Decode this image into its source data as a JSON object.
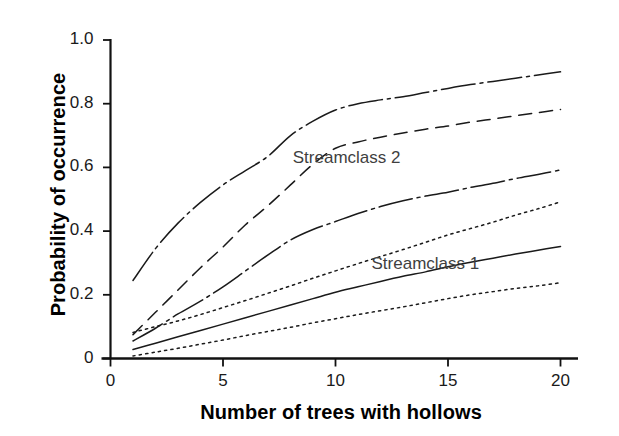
{
  "chart_data": {
    "type": "line",
    "title": "",
    "xlabel": "Number of trees with hollows",
    "ylabel": "Probability of occurrence",
    "xlim": [
      0,
      20.6
    ],
    "ylim": [
      0,
      1.0
    ],
    "grid": false,
    "legend_position": "inline-annotations",
    "xticks": [
      0,
      5,
      10,
      15,
      20
    ],
    "xtick_labels": [
      "0",
      "5",
      "10",
      "15",
      "20"
    ],
    "yticks": [
      0,
      0.2,
      0.4,
      0.6,
      0.8,
      1.0
    ],
    "ytick_labels": [
      "0",
      "0.2",
      "0.4",
      "0.6",
      "0.8",
      "1.0"
    ],
    "x": [
      1,
      2,
      3,
      4,
      5,
      6,
      7,
      8,
      9,
      10,
      11,
      12,
      13,
      14,
      15,
      16,
      17,
      18,
      19,
      20
    ],
    "annotations": [
      {
        "text": "Streamclass 2",
        "x": 8.1,
        "y": 0.625
      },
      {
        "text": "Streamclass 1",
        "x": 11.6,
        "y": 0.295
      }
    ],
    "series": [
      {
        "name": "curve-1",
        "style": "dash-dot",
        "color": "#1a1a1a",
        "values": [
          0.245,
          0.345,
          0.425,
          0.49,
          0.545,
          0.59,
          0.635,
          0.7,
          0.745,
          0.78,
          0.8,
          0.812,
          0.822,
          0.835,
          0.848,
          0.86,
          0.87,
          0.88,
          0.89,
          0.9
        ]
      },
      {
        "name": "curve-2",
        "style": "dashed",
        "color": "#1a1a1a",
        "values": [
          0.075,
          0.145,
          0.215,
          0.285,
          0.35,
          0.42,
          0.48,
          0.545,
          0.61,
          0.66,
          0.68,
          0.695,
          0.708,
          0.72,
          0.73,
          0.742,
          0.752,
          0.762,
          0.772,
          0.782
        ]
      },
      {
        "name": "curve-3",
        "style": "dash-dot",
        "color": "#1a1a1a",
        "values": [
          0.055,
          0.095,
          0.14,
          0.18,
          0.225,
          0.275,
          0.325,
          0.372,
          0.405,
          0.43,
          0.455,
          0.477,
          0.495,
          0.51,
          0.522,
          0.537,
          0.55,
          0.565,
          0.578,
          0.592
        ]
      },
      {
        "name": "curve-4",
        "style": "dotted",
        "color": "#1a1a1a",
        "values": [
          0.082,
          0.1,
          0.118,
          0.138,
          0.16,
          0.182,
          0.205,
          0.228,
          0.252,
          0.275,
          0.298,
          0.32,
          0.342,
          0.365,
          0.388,
          0.408,
          0.428,
          0.45,
          0.47,
          0.492
        ]
      },
      {
        "name": "curve-5",
        "style": "solid",
        "color": "#1a1a1a",
        "values": [
          0.028,
          0.048,
          0.068,
          0.088,
          0.108,
          0.128,
          0.148,
          0.168,
          0.188,
          0.208,
          0.225,
          0.242,
          0.258,
          0.272,
          0.288,
          0.302,
          0.315,
          0.328,
          0.34,
          0.352
        ]
      },
      {
        "name": "curve-6",
        "style": "dotted",
        "color": "#1a1a1a",
        "values": [
          0.008,
          0.02,
          0.032,
          0.045,
          0.058,
          0.072,
          0.085,
          0.098,
          0.112,
          0.125,
          0.138,
          0.15,
          0.162,
          0.175,
          0.188,
          0.2,
          0.21,
          0.22,
          0.228,
          0.238
        ]
      }
    ]
  }
}
